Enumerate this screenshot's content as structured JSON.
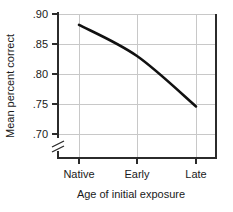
{
  "chart_data": {
    "type": "line",
    "title": "",
    "subtitle": "",
    "xlabel": "Age of initial exposure",
    "ylabel": "Mean percent correct",
    "categories": [
      "Native",
      "Early",
      "Late"
    ],
    "series": [
      {
        "name": "Mean percent correct",
        "values": [
          0.882,
          0.83,
          0.746
        ]
      }
    ],
    "ytick_labels": [
      ".90",
      ".85",
      ".80",
      ".75",
      ".70"
    ],
    "ytick_values": [
      0.9,
      0.85,
      0.8,
      0.75,
      0.7
    ],
    "xtick_labels": [
      "Native",
      "Early",
      "Late"
    ],
    "ylim": [
      0.7,
      0.9
    ],
    "grid": true,
    "grid_color": "#c8c8c8",
    "axis_color": "#2b2b2b",
    "line_color": "#111111",
    "background": "#ffffff",
    "axis_break": true,
    "axis_break_note": "y-axis break below .70",
    "legend": "none",
    "annotations": []
  }
}
